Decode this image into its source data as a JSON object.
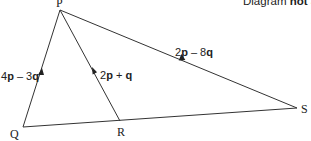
{
  "diagram": {
    "note_prefix": "Diagram ",
    "note_bold": "not",
    "note_suffix": " ac",
    "vertices": {
      "P": "P",
      "Q": "Q",
      "R": "R",
      "S": "S"
    },
    "vectors": {
      "QP": {
        "coef1": "4",
        "v1": "p",
        "op": " – ",
        "coef2": "3",
        "v2": "q"
      },
      "RP": {
        "coef1": "2",
        "v1": "p",
        "op": " + ",
        "coef2": "",
        "v2": "q"
      },
      "PS": {
        "coef1": "2",
        "v1": "p",
        "op": " – ",
        "coef2": "8",
        "v2": "q"
      }
    },
    "line_color": "#333333"
  }
}
